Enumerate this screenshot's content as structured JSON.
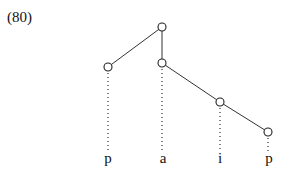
{
  "example": {
    "number": "(80)"
  },
  "tree": {
    "nodes": [
      {
        "id": "root",
        "x": 162,
        "y": 27
      },
      {
        "id": "n1",
        "x": 108,
        "y": 67
      },
      {
        "id": "n2",
        "x": 162,
        "y": 63
      },
      {
        "id": "n3",
        "x": 220,
        "y": 102
      },
      {
        "id": "n4",
        "x": 268,
        "y": 132
      }
    ],
    "edges": [
      [
        "root",
        "n1"
      ],
      [
        "root",
        "n2"
      ],
      [
        "n2",
        "n3"
      ],
      [
        "n3",
        "n4"
      ]
    ],
    "associations": [
      {
        "node": "n1",
        "segment": 0
      },
      {
        "node": "n2",
        "segment": 1
      },
      {
        "node": "n3",
        "segment": 2
      },
      {
        "node": "n4",
        "segment": 3
      }
    ]
  },
  "segments": [
    {
      "label": "p",
      "x": 108
    },
    {
      "label": "a",
      "x": 163
    },
    {
      "label": "i",
      "x": 220
    },
    {
      "label": "p",
      "x": 269
    }
  ]
}
